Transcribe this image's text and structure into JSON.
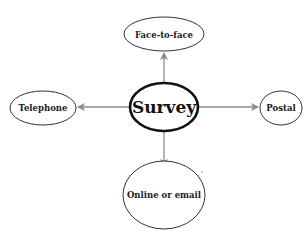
{
  "diagram": {
    "type": "hub-and-spoke",
    "center": {
      "id": "survey",
      "label": "Survey"
    },
    "nodes": [
      {
        "id": "face-to-face",
        "label": "Face-to-face",
        "position": "top"
      },
      {
        "id": "telephone",
        "label": "Telephone",
        "position": "left"
      },
      {
        "id": "postal",
        "label": "Postal",
        "position": "right"
      },
      {
        "id": "online-or-email",
        "label": "Online or email",
        "position": "bottom"
      }
    ],
    "edges": [
      {
        "from": "survey",
        "to": "face-to-face",
        "directed": true
      },
      {
        "from": "survey",
        "to": "telephone",
        "directed": true
      },
      {
        "from": "survey",
        "to": "postal",
        "directed": true
      },
      {
        "from": "survey",
        "to": "online-or-email",
        "directed": true
      }
    ],
    "colors": {
      "center_border": "#111111",
      "node_border": "#333333",
      "arrow": "#8c8c8c",
      "background": "#ffffff"
    }
  }
}
